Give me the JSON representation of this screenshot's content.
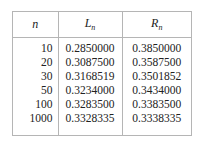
{
  "table": {
    "headers": [
      {
        "main": "n",
        "sub": ""
      },
      {
        "main": "L",
        "sub": "n"
      },
      {
        "main": "R",
        "sub": "n"
      }
    ],
    "rows": [
      {
        "n": "10",
        "L": "0.2850000",
        "R": "0.3850000"
      },
      {
        "n": "20",
        "L": "0.3087500",
        "R": "0.3587500"
      },
      {
        "n": "30",
        "L": "0.3168519",
        "R": "0.3501852"
      },
      {
        "n": "50",
        "L": "0.3234000",
        "R": "0.3434000"
      },
      {
        "n": "100",
        "L": "0.3283500",
        "R": "0.3383500"
      },
      {
        "n": "1000",
        "L": "0.3328335",
        "R": "0.3338335"
      }
    ]
  }
}
